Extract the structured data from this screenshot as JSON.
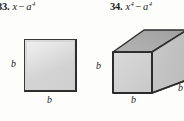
{
  "page": {
    "background_color": "#fdfdfc",
    "text_color": "#1c1c1c"
  },
  "exercises": [
    {
      "number": "33.",
      "expression_base": "x",
      "expression_operator": "−",
      "expression_term": "a",
      "expression_exponent": "4",
      "expression_plain": "x − a⁴",
      "figure": {
        "type": "square",
        "labels": [
          {
            "name": "height",
            "text": "b"
          },
          {
            "name": "width",
            "text": "b"
          }
        ],
        "fill_color": "#d6d6d6",
        "stroke_color": "#2e2e2e"
      }
    },
    {
      "number": "34.",
      "expression_base": "x",
      "expression_base_exponent": "4",
      "expression_operator": "−",
      "expression_term": "a",
      "expression_exponent": "4",
      "expression_plain": "x⁴ − a⁴",
      "figure": {
        "type": "rectangular-prism",
        "labels": [
          {
            "name": "height",
            "text": "b"
          },
          {
            "name": "width",
            "text": "b"
          },
          {
            "name": "depth",
            "text": "b"
          }
        ],
        "front_face_color": "#d2d2d2",
        "top_face_color": "#a9a9a9",
        "side_face_color": "#c3c3c3",
        "stroke_color": "#2e2e2e"
      }
    }
  ]
}
